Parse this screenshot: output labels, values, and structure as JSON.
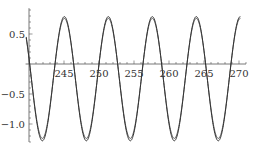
{
  "chart_data": {
    "type": "line",
    "title": "",
    "xlabel": "",
    "ylabel": "",
    "xlim": [
      239.8,
      271
    ],
    "ylim": [
      -1.3,
      0.93
    ],
    "grid": false,
    "legend": null,
    "x_ticks": [
      245,
      250,
      255,
      260,
      265,
      270
    ],
    "x_tick_labels": [
      "245",
      "250",
      "255",
      "260",
      "265",
      "270"
    ],
    "y_ticks": [
      0.5,
      -0.5,
      -1.0
    ],
    "y_tick_labels": [
      "0.5",
      "-0.5",
      "-1.0"
    ],
    "x_minor_step": 1,
    "y_minor_step": 0.1,
    "series": [
      {
        "name": "curve-1",
        "color": "#333333",
        "model": {
          "offset": -0.245,
          "amplitude": 1.035,
          "peak_x": 245.05,
          "period": 6.283
        },
        "x": [
          240,
          241,
          241.9,
          243,
          244,
          245.05,
          246,
          247,
          248.2,
          249,
          250,
          251.35,
          252,
          253,
          254.5,
          255,
          256,
          257.6,
          258,
          259,
          260.8,
          261,
          262,
          263.9,
          264,
          265,
          267.1,
          268,
          269,
          270.2
        ],
        "values": [
          0.16,
          -0.84,
          -1.28,
          -0.7,
          0.31,
          0.79,
          0.39,
          -0.68,
          -1.28,
          -0.94,
          0.05,
          0.79,
          0.57,
          -0.43,
          -1.28,
          -1.19,
          -0.27,
          0.79,
          0.7,
          -0.15,
          -1.27,
          -1.27,
          -0.63,
          0.79,
          0.78,
          0.35,
          -1.28,
          -0.87,
          0.1,
          0.79
        ]
      },
      {
        "name": "curve-2",
        "color": "#333333",
        "model": {
          "offset": -0.24,
          "amplitude": 1.0,
          "peak_x": 245.05,
          "period": 6.283
        },
        "x": [
          240,
          241.9,
          245.05,
          248.2,
          251.35,
          254.5,
          257.6,
          260.8,
          263.9,
          267.1,
          270.2
        ],
        "values": [
          0.15,
          -1.24,
          0.76,
          -1.24,
          0.76,
          -1.24,
          0.76,
          -1.24,
          0.76,
          -1.24,
          0.76
        ]
      }
    ]
  },
  "axes": {
    "color": "#555555",
    "line_color": "#333333"
  }
}
